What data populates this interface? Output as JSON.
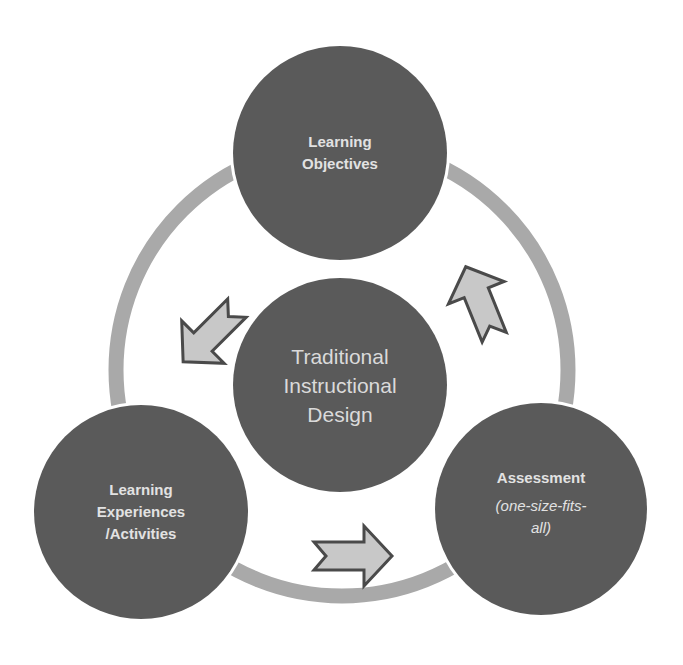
{
  "diagram": {
    "title": "Traditional Instructional Design",
    "colors": {
      "node_fill": "#5a5a5a",
      "ring": "#a9a9a9",
      "arrow_fill": "#c8c8c8",
      "arrow_stroke": "#4a4a4a",
      "label_text": "#e2e2e2",
      "background": "#ffffff"
    },
    "center": {
      "lines": [
        "Traditional",
        "Instructional",
        "Design"
      ]
    },
    "nodes": [
      {
        "id": "learning-objectives",
        "lines": [
          "Learning",
          "Objectives"
        ],
        "subtitle": ""
      },
      {
        "id": "assessment",
        "lines": [
          "Assessment"
        ],
        "subtitle_lines": [
          "(one-size-fits-",
          "all)"
        ]
      },
      {
        "id": "learning-experiences",
        "lines": [
          "Learning",
          "Experiences",
          "/Activities"
        ],
        "subtitle": ""
      }
    ],
    "arrows": [
      {
        "from": "learning-objectives",
        "to": "learning-experiences",
        "direction": "down-left"
      },
      {
        "from": "learning-experiences",
        "to": "assessment",
        "direction": "right"
      },
      {
        "from": "assessment",
        "to": "learning-objectives",
        "direction": "up"
      }
    ]
  }
}
